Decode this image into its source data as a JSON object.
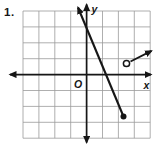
{
  "figure": {
    "problem_number": "1.",
    "background": "#ffffff",
    "colors": {
      "grid": "#9a9a9a",
      "ink": "#161616",
      "point_fill": "#161616",
      "open_point_fill": "#ffffff"
    },
    "grid": {
      "cols": 8,
      "rows": 8,
      "x0": 23,
      "y0": 11,
      "cell": 15.9
    },
    "axes_px": {
      "origin": [
        86.6,
        74.6
      ],
      "x_left_tip": [
        10,
        74.6
      ],
      "x_right_tip": [
        151,
        74.6
      ],
      "y_top_tip": [
        86.6,
        4.5
      ],
      "y_bottom_tip": [
        86.6,
        142.5
      ]
    },
    "labels": {
      "x_axis": "x",
      "y_axis": "y",
      "origin": "O"
    },
    "shapes": {
      "line_segment": {
        "dot_px": [
          123.5,
          116.5
        ],
        "arrow_tip_px": [
          78,
          7.5
        ],
        "dot_radius": 3
      },
      "ray": {
        "open_circle_px": [
          126.5,
          63.5
        ],
        "circle_radius": 3.1,
        "arrow_tip_px": [
          151.5,
          50.9
        ]
      }
    }
  },
  "chart_data": {
    "type": "line",
    "title": "",
    "axes": {
      "xlabel": "x",
      "ylabel": "y",
      "origin_label": "O",
      "xlim": [
        -4,
        4
      ],
      "ylim": [
        -4,
        4
      ],
      "grid": true,
      "tick_step": 1,
      "tick_labels_shown": false
    },
    "series": [
      {
        "name": "steep-segment",
        "description": "line from arrow in upper left down to closed (filled) endpoint in lower right",
        "endpoints_grid": [
          [
            -0.6,
            4.4
          ],
          [
            2.3,
            -2.6
          ]
        ],
        "start_marker": "arrow",
        "end_marker": "closed-dot",
        "approx_slope": -2.4
      },
      {
        "name": "open-ray",
        "description": "short ray from open circle rising toward arrow at upper right",
        "endpoints_grid": [
          [
            2.5,
            0.7
          ],
          [
            4.1,
            1.5
          ]
        ],
        "start_marker": "open-dot",
        "end_marker": "arrow",
        "approx_slope": 0.5
      }
    ]
  }
}
